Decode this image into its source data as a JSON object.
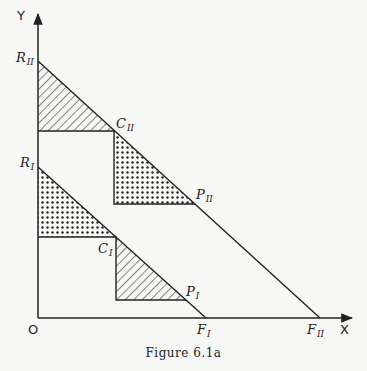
{
  "figure": {
    "caption": "Figure 6.1a",
    "axes": {
      "y_label": "Y",
      "x_label": "X",
      "origin_label": "O"
    },
    "points": {
      "R_II": {
        "letter": "R",
        "sub": "II"
      },
      "C_II": {
        "letter": "C",
        "sub": "II"
      },
      "P_II": {
        "letter": "P",
        "sub": "II"
      },
      "R_I": {
        "letter": "R",
        "sub": "I"
      },
      "C_I": {
        "letter": "C",
        "sub": "I"
      },
      "P_I": {
        "letter": "P",
        "sub": "I"
      },
      "F_I": {
        "letter": "F",
        "sub": "I"
      },
      "F_II": {
        "letter": "F",
        "sub": "II"
      }
    },
    "regions": [
      {
        "name": "R_II-C_II upper triangle",
        "fill": "hatched"
      },
      {
        "name": "C_II-P_II lower triangle",
        "fill": "dotted"
      },
      {
        "name": "R_I-C_I upper triangle",
        "fill": "dotted"
      },
      {
        "name": "C_I-P_I lower triangle",
        "fill": "hatched"
      }
    ],
    "colors": {
      "line": "#222222",
      "background": "#f7f7f5"
    }
  }
}
